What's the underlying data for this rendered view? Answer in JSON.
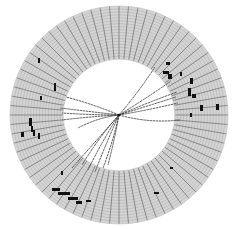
{
  "display": {
    "type": "detector-event-display",
    "center": [
      119,
      115
    ],
    "outer_radius": 109,
    "inner_radius": 56,
    "radial_segments": 72,
    "ring_layers": 18,
    "colors": {
      "background": "#ffffff",
      "ring_fill": "#d4d4d4",
      "segment_line": "#6a6a6a",
      "layer_line": "#9a9a9a",
      "hit": "#111111",
      "track": "#333333"
    }
  },
  "tracks": [
    {
      "end": [
        155,
        67
      ],
      "bend": 2
    },
    {
      "end": [
        171,
        81
      ],
      "bend": 1
    },
    {
      "end": [
        177,
        92
      ],
      "bend": -1
    },
    {
      "end": [
        176,
        97
      ],
      "bend": 0
    },
    {
      "end": [
        178,
        103
      ],
      "bend": 1
    },
    {
      "end": [
        180,
        120
      ],
      "bend": 6
    },
    {
      "end": [
        66,
        97
      ],
      "bend": 2
    },
    {
      "end": [
        60,
        108
      ],
      "bend": 0
    },
    {
      "end": [
        62,
        113
      ],
      "bend": -1
    },
    {
      "end": [
        62,
        120
      ],
      "bend": 1
    },
    {
      "end": [
        78,
        128
      ],
      "bend": 4
    },
    {
      "end": [
        82,
        165
      ],
      "bend": 3
    },
    {
      "end": [
        88,
        170
      ],
      "bend": 2
    },
    {
      "end": [
        95,
        172
      ],
      "bend": 1
    },
    {
      "end": [
        103,
        168
      ],
      "bend": -2
    },
    {
      "end": [
        108,
        165
      ],
      "bend": -1
    },
    {
      "end": [
        72,
        168
      ],
      "bend": 0
    }
  ],
  "hits": [
    {
      "x": 166,
      "y": 62,
      "w": 4,
      "h": 3
    },
    {
      "x": 163,
      "y": 71,
      "w": 6,
      "h": 3
    },
    {
      "x": 168,
      "y": 74,
      "w": 4,
      "h": 5
    },
    {
      "x": 180,
      "y": 72,
      "w": 2,
      "h": 4
    },
    {
      "x": 190,
      "y": 78,
      "w": 3,
      "h": 6
    },
    {
      "x": 188,
      "y": 88,
      "w": 3,
      "h": 8
    },
    {
      "x": 192,
      "y": 94,
      "w": 4,
      "h": 4
    },
    {
      "x": 200,
      "y": 105,
      "w": 3,
      "h": 6
    },
    {
      "x": 216,
      "y": 104,
      "w": 3,
      "h": 6
    },
    {
      "x": 190,
      "y": 113,
      "w": 2,
      "h": 4
    },
    {
      "x": 38,
      "y": 58,
      "w": 2,
      "h": 5
    },
    {
      "x": 54,
      "y": 83,
      "w": 2,
      "h": 8
    },
    {
      "x": 40,
      "y": 96,
      "w": 2,
      "h": 4
    },
    {
      "x": 29,
      "y": 118,
      "w": 3,
      "h": 8
    },
    {
      "x": 31,
      "y": 126,
      "w": 2,
      "h": 6
    },
    {
      "x": 33,
      "y": 130,
      "w": 2,
      "h": 6
    },
    {
      "x": 21,
      "y": 132,
      "w": 3,
      "h": 5
    },
    {
      "x": 38,
      "y": 133,
      "w": 2,
      "h": 6
    },
    {
      "x": 61,
      "y": 171,
      "w": 2,
      "h": 4
    },
    {
      "x": 52,
      "y": 188,
      "w": 8,
      "h": 3
    },
    {
      "x": 58,
      "y": 192,
      "w": 12,
      "h": 3
    },
    {
      "x": 68,
      "y": 197,
      "w": 10,
      "h": 3
    },
    {
      "x": 76,
      "y": 201,
      "w": 6,
      "h": 3
    },
    {
      "x": 86,
      "y": 200,
      "w": 5,
      "h": 2
    },
    {
      "x": 154,
      "y": 192,
      "w": 5,
      "h": 2
    },
    {
      "x": 170,
      "y": 167,
      "w": 3,
      "h": 2
    }
  ]
}
